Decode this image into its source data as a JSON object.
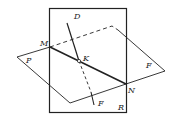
{
  "diagram": {
    "type": "geometry-planes-intersection",
    "labels": {
      "D": "D",
      "M": "M",
      "K": "K",
      "P": "P",
      "F_right": "F",
      "F_bottom": "F",
      "N": "N",
      "R": "R"
    },
    "colors": {
      "stroke": "#222222",
      "background": "#ffffff"
    }
  }
}
